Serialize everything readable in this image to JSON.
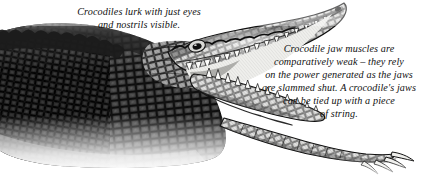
{
  "page": {
    "background_color": "#ffffff",
    "width": 446,
    "height": 184
  },
  "illustration": {
    "subject": "crocodile",
    "description": "Black and white engraving-style illustration of a crocodile lying low with its jaws open wide, body scales heavily textured, one clawed forelimb extending to the lower right.",
    "style": "pen-and-ink engraving",
    "ink_color": "#1a1a1a",
    "midtone_color": "#6b6b6b",
    "highlight_color": "#f2f2f0",
    "parts": [
      "armoured-body",
      "scaly-back-ridge",
      "head",
      "upper-jaw",
      "lower-jaw",
      "teeth",
      "eye",
      "nostril",
      "foreleg",
      "claws"
    ]
  },
  "captions": {
    "left": "Crocodiles lurk with just eyes\nand nostrils visible.",
    "right": "Crocodile jaw muscles are\ncomparatively weak – they rely\non the power generated as the jaws\nare slammed shut. A crocodile's jaws\ncan be tied up with a piece\nof string."
  }
}
